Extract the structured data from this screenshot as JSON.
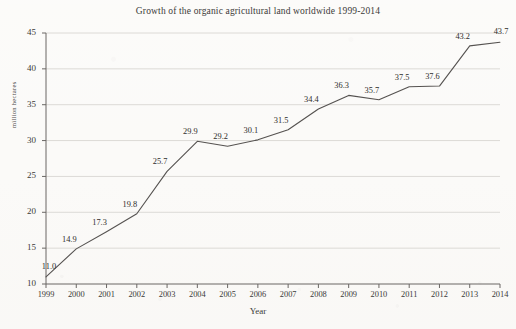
{
  "chart_data": {
    "type": "line",
    "title": "Growth of the organic agricultural land worldwide 1999-2014",
    "xlabel": "Year",
    "ylabel": "million hectares",
    "categories": [
      "1999",
      "2000",
      "2001",
      "2002",
      "2003",
      "2004",
      "2005",
      "2006",
      "2007",
      "2008",
      "2009",
      "2010",
      "2011",
      "2012",
      "2013",
      "2014"
    ],
    "values": [
      11.0,
      14.9,
      17.3,
      19.8,
      25.7,
      29.9,
      29.2,
      30.1,
      31.5,
      34.4,
      36.3,
      35.7,
      37.5,
      37.6,
      43.2,
      43.7
    ],
    "point_labels": [
      "11.0",
      "14.9",
      "17.3",
      "19.8",
      "25.7",
      "29.9",
      "29.2",
      "30.1",
      "31.5",
      "34.4",
      "36.3",
      "35.7",
      "37.5",
      "37.6",
      "43.2",
      "43.7"
    ],
    "ylim": [
      10,
      45
    ],
    "yticks": [
      10,
      15,
      20,
      25,
      30,
      35,
      40,
      45
    ],
    "ytick_labels": [
      "10",
      "15",
      "20",
      "25",
      "30",
      "35",
      "40",
      "45"
    ],
    "grid": true,
    "grid_axis": "y",
    "legend": false,
    "line_color": "#555250",
    "grid_color": "#dcdad6",
    "axis_color": "#6a6764",
    "text_color": "#3b3a38",
    "background_color": "#fbfaf8"
  }
}
